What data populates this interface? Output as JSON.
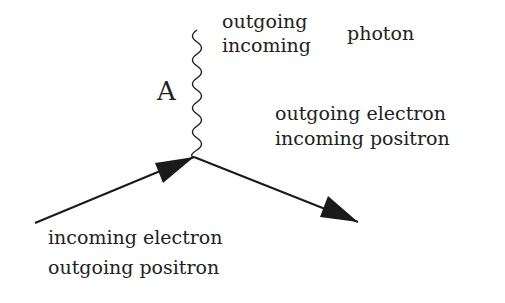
{
  "diagram": {
    "photon_label": "A",
    "photon_top": [
      "outgoing",
      "incoming"
    ],
    "photon_name": "photon",
    "right_lines": [
      "outgoing electron",
      "incoming positron"
    ],
    "left_lines": [
      "incoming electron",
      "outgoing positron"
    ],
    "line_color": "#1a1a1a"
  }
}
